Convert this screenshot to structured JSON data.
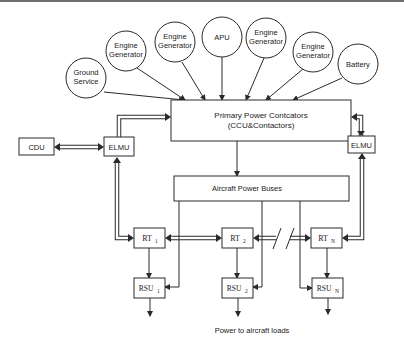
{
  "sources": [
    {
      "id": "ground-service",
      "lines": [
        "Ground",
        "Service"
      ]
    },
    {
      "id": "engine-generator-1",
      "lines": [
        "Engine",
        "Generator"
      ]
    },
    {
      "id": "engine-generator-2",
      "lines": [
        "Engine",
        "Generator"
      ]
    },
    {
      "id": "apu",
      "lines": [
        "APU"
      ]
    },
    {
      "id": "engine-generator-3",
      "lines": [
        "Engine",
        "Generator"
      ]
    },
    {
      "id": "engine-generator-4",
      "lines": [
        "Engine",
        "Generator"
      ]
    },
    {
      "id": "battery",
      "lines": [
        "Battery"
      ]
    }
  ],
  "primary": {
    "line1": "Primary Power Contcators",
    "line2": "(CCU&Contactors)"
  },
  "buses": {
    "label": "Aircraft Power Buses"
  },
  "cdu": {
    "label": "CDU"
  },
  "elmu_left": {
    "label": "ELMU"
  },
  "elmu_right": {
    "label": "ELMU"
  },
  "rt": [
    {
      "base": "RT",
      "sub": "1"
    },
    {
      "base": "RT",
      "sub": "2"
    },
    {
      "base": "RT",
      "sub": "N"
    }
  ],
  "rsu": [
    {
      "base": "RSU",
      "sub": "1"
    },
    {
      "base": "RSU",
      "sub": "2"
    },
    {
      "base": "RSU",
      "sub": "N"
    }
  ],
  "footer": {
    "label": "Power to aircraft loads"
  },
  "colors": {
    "stroke": "#2a2a2a",
    "background": "#ffffff",
    "topbar": "#6e6e6e"
  }
}
